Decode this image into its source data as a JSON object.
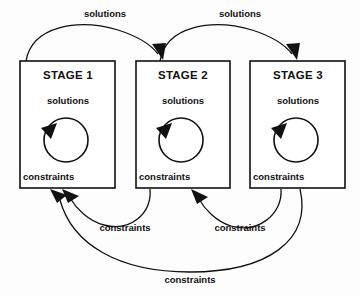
{
  "diagram": {
    "type": "cyclic-stage-flow-diagram",
    "background_color": "#fdfdfd",
    "line_color": "#111111",
    "stages": [
      {
        "id": "stage-1",
        "title": "STAGE 1",
        "inner_top_label": "solutions",
        "inner_bottom_label": "constraints",
        "has_self_loop": true
      },
      {
        "id": "stage-2",
        "title": "STAGE 2",
        "inner_top_label": "solutions",
        "inner_bottom_label": "constraints",
        "has_self_loop": true
      },
      {
        "id": "stage-3",
        "title": "STAGE 3",
        "inner_top_label": "solutions",
        "inner_bottom_label": "constraints",
        "has_self_loop": true
      }
    ],
    "edges": [
      {
        "id": "edge-solutions-1-2",
        "label": "solutions",
        "from": "stage-1",
        "to": "stage-2",
        "direction": "forward",
        "position": "top"
      },
      {
        "id": "edge-solutions-2-3",
        "label": "solutions",
        "from": "stage-2",
        "to": "stage-3",
        "direction": "forward",
        "position": "top"
      },
      {
        "id": "edge-constraints-2-1",
        "label": "constraints",
        "from": "stage-2",
        "to": "stage-1",
        "direction": "backward",
        "position": "bottom"
      },
      {
        "id": "edge-constraints-3-2",
        "label": "constraints",
        "from": "stage-3",
        "to": "stage-2",
        "direction": "backward",
        "position": "bottom"
      },
      {
        "id": "edge-constraints-3-1",
        "label": "constraints",
        "from": "stage-3",
        "to": "stage-1",
        "direction": "backward",
        "position": "bottom-outer"
      }
    ]
  }
}
